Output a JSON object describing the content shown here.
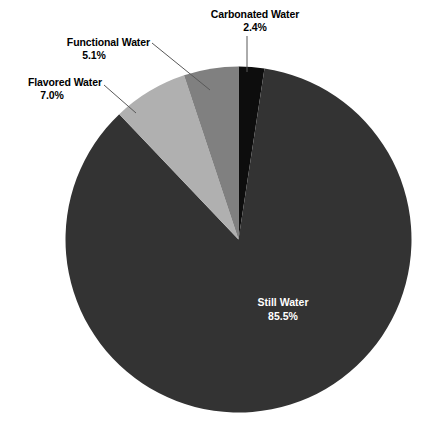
{
  "chart_data": {
    "type": "pie",
    "title": "",
    "subtitle": "",
    "xlabel": "",
    "ylabel": "",
    "legend_position": "none",
    "grid": false,
    "value_suffix": "%",
    "categories": [
      "Still Water",
      "Carbonated Water",
      "Flavored Water",
      "Functional Water"
    ],
    "values": [
      85.5,
      2.4,
      7.0,
      5.1
    ],
    "slices": [
      {
        "label": "Carbonated Water",
        "value": 2.4,
        "value_text": "2.4%",
        "color": "#0d0d0d",
        "label_placement": "outside-top",
        "leader_line": true
      },
      {
        "label": "Still Water",
        "value": 85.5,
        "value_text": "85.5%",
        "color": "#333333",
        "label_placement": "inside",
        "label_color": "#ffffff",
        "leader_line": false
      },
      {
        "label": "Flavored Water",
        "value": 7.0,
        "value_text": "7.0%",
        "color": "#b0b0b0",
        "label_placement": "outside-left",
        "leader_line": true
      },
      {
        "label": "Functional Water",
        "value": 5.1,
        "value_text": "5.1%",
        "color": "#808080",
        "label_placement": "outside-upper-left",
        "leader_line": true
      }
    ],
    "background_color": "#ffffff",
    "leader_line_color": "#595959",
    "start_angle_deg": 0,
    "direction": "clockwise",
    "total": 100.0
  },
  "labels": {
    "carbonated": {
      "category": "Carbonated Water",
      "percent": "2.4%"
    },
    "functional": {
      "category": "Functional Water",
      "percent": "5.1%"
    },
    "flavored": {
      "category": "Flavored Water",
      "percent": "7.0%"
    },
    "still": {
      "category": "Still Water",
      "percent": "85.5%"
    }
  }
}
